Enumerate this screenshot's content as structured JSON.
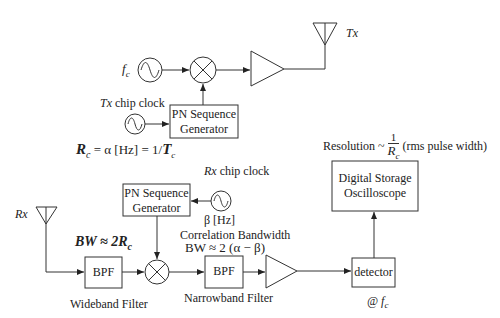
{
  "transmitter": {
    "carrier_label": "f",
    "carrier_sub": "c",
    "antenna_label": "Tx",
    "chip_clock_label_italic": "Tx",
    "chip_clock_label_rest": " chip clock",
    "pn_line1": "PN Sequence",
    "pn_line2": "Generator",
    "rate_eq_R": "R",
    "rate_eq_sub": "c",
    "rate_eq_mid": " = α [Hz] = 1/",
    "rate_eq_T": "T",
    "rate_eq_Tsub": "c"
  },
  "receiver": {
    "antenna_label": "Rx",
    "pn_line1": "PN Sequence",
    "pn_line2": "Generator",
    "chip_clock_label_italic": "Rx",
    "chip_clock_label_rest": " chip clock",
    "chip_clock_freq": "β [Hz]",
    "wide_bw_label": "BW ≈ 2R",
    "wide_bw_sub": "c",
    "bpf1_label": "BPF",
    "wideband_caption": "Wideband Filter",
    "corr_bw_title": "Correlation Bandwidth",
    "corr_bw_eq": "BW ≈ 2 (α − β)",
    "bpf2_label": "BPF",
    "narrowband_caption": "Narrowband Filter",
    "detector_label": "detector",
    "detector_freq": "@ f",
    "detector_freq_sub": "c",
    "dso_line1": "Digital Storage",
    "dso_line2": "Oscilloscope",
    "resolution_prefix": "Resolution ~ ",
    "resolution_num": "1",
    "resolution_den": "R",
    "resolution_den_sub": "c",
    "resolution_suffix": " (rms pulse width)"
  },
  "colors": {
    "stroke": "#333333",
    "background": "#ffffff"
  }
}
